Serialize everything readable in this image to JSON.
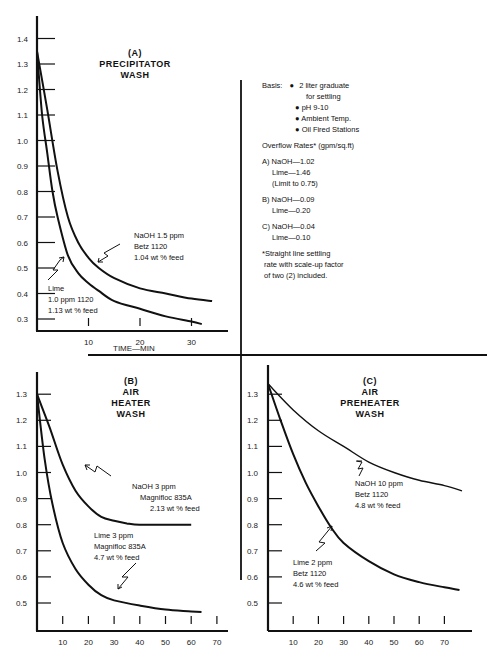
{
  "chart_data": [
    {
      "id": "A",
      "type": "line",
      "title": "(A) PRECIPITATOR WASH",
      "title_lines": [
        "(A)",
        "PRECIPITATOR",
        "WASH"
      ],
      "xlabel": "TIME—MIN",
      "ylabel": "",
      "xlim": [
        0,
        35
      ],
      "ylim": [
        0.25,
        1.45
      ],
      "x_ticks": [
        10,
        20,
        30
      ],
      "y_ticks": [
        1.4,
        1.3,
        1.2,
        1.1,
        1.0,
        0.9,
        0.8,
        0.7,
        0.6,
        0.5,
        0.4,
        0.3
      ],
      "series": [
        {
          "name": "NaOH 1.5 ppm Betz 1120 1.04 wt % feed",
          "x": [
            0,
            2,
            4,
            6,
            8,
            10,
            12,
            15,
            20,
            25,
            30,
            34
          ],
          "y": [
            1.35,
            1.12,
            0.88,
            0.7,
            0.6,
            0.54,
            0.5,
            0.46,
            0.42,
            0.4,
            0.38,
            0.37
          ]
        },
        {
          "name": "Lime 1.0 ppm 1120 1.13 wt % feed",
          "x": [
            0,
            1,
            2,
            3,
            4,
            6,
            8,
            10,
            12,
            15,
            20,
            25,
            30,
            32
          ],
          "y": [
            1.35,
            1.1,
            0.95,
            0.8,
            0.7,
            0.55,
            0.48,
            0.44,
            0.41,
            0.37,
            0.34,
            0.31,
            0.29,
            0.28
          ]
        }
      ],
      "annotations": [
        {
          "lines": [
            "NaOH 1.5 ppm",
            "Betz 1120",
            "1.04 wt % feed"
          ]
        },
        {
          "lines": [
            "Lime",
            "1.0 ppm 1120",
            "1.13 wt % feed"
          ]
        }
      ]
    },
    {
      "id": "B",
      "type": "line",
      "title": "(B) AIR HEATER WASH",
      "title_lines": [
        "(B)",
        "AIR",
        "HEATER",
        "WASH"
      ],
      "xlabel": "",
      "ylabel": "",
      "xlim": [
        0,
        72
      ],
      "ylim": [
        0.4,
        1.35
      ],
      "x_ticks": [
        10,
        20,
        30,
        40,
        50,
        60,
        70
      ],
      "y_ticks": [
        1.3,
        1.2,
        1.1,
        1.0,
        0.9,
        0.8,
        0.7,
        0.6,
        0.5
      ],
      "series": [
        {
          "name": "NaOH 3 ppm Magnifloc 835A 2.13 wt % feed",
          "x": [
            0,
            5,
            10,
            15,
            20,
            25,
            30,
            35,
            40,
            50,
            60
          ],
          "y": [
            1.3,
            1.17,
            1.03,
            0.93,
            0.87,
            0.83,
            0.815,
            0.805,
            0.8,
            0.8,
            0.8
          ]
        },
        {
          "name": "Lime 3 ppm Magnifloc 835A 4.7 wt % feed",
          "x": [
            0,
            3,
            6,
            10,
            15,
            20,
            25,
            30,
            40,
            50,
            60,
            64
          ],
          "y": [
            1.3,
            1.05,
            0.88,
            0.73,
            0.63,
            0.57,
            0.53,
            0.51,
            0.49,
            0.475,
            0.468,
            0.465
          ]
        }
      ],
      "annotations": [
        {
          "lines": [
            "NaOH 3 ppm",
            "Magnifloc 835A",
            "2.13 wt % feed"
          ]
        },
        {
          "lines": [
            "Lime 3 ppm",
            "Magnifloc 835A",
            "4.7 wt % feed"
          ]
        }
      ]
    },
    {
      "id": "C",
      "type": "line",
      "title": "(C) AIR PREHEATER WASH",
      "title_lines": [
        "(C)",
        "AIR",
        "PREHEATER",
        "WASH"
      ],
      "xlabel": "",
      "ylabel": "",
      "xlim": [
        0,
        80
      ],
      "ylim": [
        0.4,
        1.4
      ],
      "x_ticks": [
        10,
        20,
        30,
        40,
        50,
        60,
        70
      ],
      "y_ticks": [
        1.3,
        1.2,
        1.1,
        1.0,
        0.9,
        0.8,
        0.7,
        0.6,
        0.5
      ],
      "series": [
        {
          "name": "NaOH 10 ppm Betz 1120 4.8 wt % feed",
          "x": [
            0,
            10,
            20,
            30,
            40,
            50,
            60,
            70,
            77
          ],
          "y": [
            1.34,
            1.24,
            1.16,
            1.1,
            1.04,
            1.0,
            0.97,
            0.95,
            0.93
          ]
        },
        {
          "name": "Lime 2 ppm Betz 1120 4.6 wt % feed",
          "x": [
            0,
            5,
            10,
            15,
            20,
            25,
            30,
            40,
            50,
            60,
            70,
            76
          ],
          "y": [
            1.34,
            1.2,
            1.07,
            0.96,
            0.87,
            0.79,
            0.73,
            0.66,
            0.61,
            0.58,
            0.56,
            0.55
          ]
        }
      ],
      "annotations": [
        {
          "lines": [
            "NaOH 10 ppm",
            "Betz 1120",
            "4.8 wt % feed"
          ]
        },
        {
          "lines": [
            "Lime 2 ppm",
            "Betz 1120",
            "4.6 wt % feed"
          ]
        }
      ]
    }
  ],
  "notes": {
    "basis_label": "Basis:",
    "basis_items": [
      "2 liter graduate",
      "for settling",
      "pH 9-10",
      "Ambient Temp.",
      "Oil Fired Stations"
    ],
    "overflow_title": "Overflow Rates* (gpm/sq.ft)",
    "overflow": [
      {
        "lines": [
          "A) NaOH—1.02",
          "Lime—1.46",
          "(Limit to 0.75)"
        ]
      },
      {
        "lines": [
          "B) NaOH—0.09",
          "Lime—0.20"
        ]
      },
      {
        "lines": [
          "C) NaOH—0.04",
          "Lime—0.10"
        ]
      }
    ],
    "footnote": [
      "*Straight line settling",
      "rate with scale-up factor",
      "of two (2) included."
    ]
  }
}
